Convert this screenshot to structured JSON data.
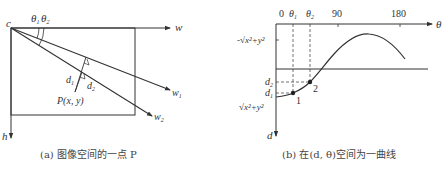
{
  "panel_a": {
    "origin_label": "c",
    "w_axis_label": "w",
    "h_axis_label": "h",
    "theta1_label": "θ",
    "theta1_sub": "1",
    "theta2_label": "θ",
    "theta2_sub": "2",
    "ray1_label": "w",
    "ray1_sub": "1",
    "ray2_label": "w",
    "ray2_sub": "2",
    "d1_label": "d",
    "d1_sub": "1",
    "d2_label": "d",
    "d2_sub": "2",
    "point_label": "P(x, y)",
    "caption": "(a) 图像空间的一点 P"
  },
  "panel_b": {
    "x_axis_label": "θ",
    "y_axis_label": "d",
    "tick_0": "0",
    "tick_theta1": "θ",
    "tick_theta1_sub": "1",
    "tick_theta2": "θ",
    "tick_theta2_sub": "2",
    "tick_90": "90",
    "tick_180": "180",
    "neg_sqrt_label": "-√x²+y²",
    "pos_sqrt_label": "√x²+y²",
    "d1_label": "d",
    "d1_sub": "1",
    "d2_label": "d",
    "d2_sub": "2",
    "point1_label": "1",
    "point2_label": "2",
    "caption": "(b) 在(d, θ)空间为一曲线"
  },
  "colors": {
    "line": "#333333",
    "text": "#333333",
    "caption": "#444444"
  }
}
